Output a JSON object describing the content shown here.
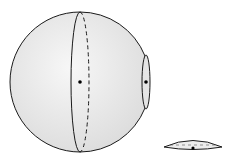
{
  "diagram": {
    "colors": {
      "fill": "#e9e9e9",
      "fill_highlight": "#f6f6f6",
      "stroke": "#1a1a1a",
      "background": "#ffffff"
    },
    "sphere": {
      "cx": 79,
      "cy": 82,
      "r": 70
    },
    "great_circle": {
      "cx": 80,
      "cy": 82,
      "rx": 9,
      "ry": 70,
      "front": "solid",
      "back": "dashed"
    },
    "cut_plane": {
      "cx": 146,
      "cy": 82,
      "rx": 4,
      "ry": 27
    },
    "center_points": [
      {
        "name": "sphere-center",
        "x": 80,
        "y": 82
      },
      {
        "name": "cut-center",
        "x": 146,
        "y": 82
      }
    ],
    "cap": {
      "cx": 193,
      "cy": 145,
      "rx": 29,
      "ry": 5,
      "point": {
        "x": 193,
        "y": 148
      }
    }
  }
}
